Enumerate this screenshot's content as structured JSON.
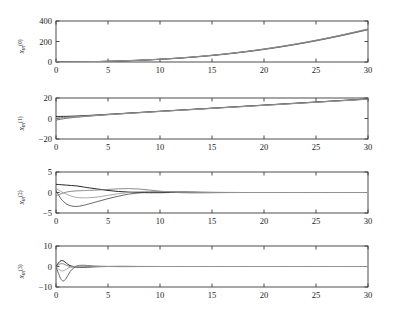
{
  "figure": {
    "background": "#ffffff",
    "axis_color": "#3a3a3a",
    "line_colors": [
      "#000000",
      "#4d4d4d",
      "#777777",
      "#9a9a9a"
    ],
    "xlabel": "",
    "xlim": [
      0,
      30
    ],
    "xticks": [
      0,
      5,
      10,
      15,
      20,
      25,
      30
    ],
    "xticklabels": [
      "0",
      "5",
      "10",
      "15",
      "20",
      "25",
      "30"
    ]
  },
  "chart_data": [
    {
      "type": "line",
      "title": "",
      "xlabel": "",
      "ylabel": "x_m^(0)",
      "ylabel_base": "x",
      "ylabel_sub": "m",
      "ylabel_sup": "(0)",
      "xlim": [
        0,
        30
      ],
      "ylim": [
        0,
        400
      ],
      "xticks": [
        0,
        5,
        10,
        15,
        20,
        25,
        30
      ],
      "yticks": [
        0,
        200,
        400
      ],
      "yticklabels": [
        "0",
        "200",
        "400"
      ],
      "grid": false,
      "legend": "none",
      "x": [
        0,
        1,
        2,
        3,
        4,
        5,
        6,
        7,
        8,
        9,
        10,
        11,
        12,
        13,
        14,
        15,
        16,
        17,
        18,
        19,
        20,
        21,
        22,
        23,
        24,
        25,
        26,
        27,
        28,
        29,
        30
      ],
      "series": [
        {
          "name": "agent 1",
          "values": [
            0,
            0.5,
            1.4,
            2.8,
            4.7,
            7.0,
            9.9,
            13.3,
            17.3,
            21.9,
            27.2,
            33.2,
            40.0,
            47.6,
            56.0,
            65.3,
            75.5,
            86.6,
            98.7,
            111.7,
            125.7,
            140.7,
            156.7,
            173.7,
            191.7,
            210.7,
            230.7,
            251.7,
            273.7,
            296.7,
            320.0
          ]
        },
        {
          "name": "agent 2",
          "values": [
            0,
            0.4,
            1.2,
            2.5,
            4.3,
            6.5,
            9.3,
            12.6,
            16.5,
            21.0,
            26.2,
            32.1,
            38.8,
            46.3,
            54.6,
            63.8,
            73.9,
            84.9,
            96.9,
            109.8,
            123.7,
            138.6,
            154.5,
            171.4,
            189.3,
            208.2,
            228.1,
            249.0,
            270.9,
            293.8,
            317.0
          ]
        },
        {
          "name": "agent 3",
          "values": [
            0,
            0.3,
            1.0,
            2.2,
            3.9,
            6.1,
            8.8,
            12.0,
            15.8,
            20.3,
            25.4,
            31.2,
            37.8,
            45.2,
            53.4,
            62.5,
            72.5,
            83.4,
            95.3,
            108.1,
            121.9,
            136.7,
            152.5,
            169.3,
            187.1,
            205.9,
            225.7,
            246.5,
            268.3,
            291.1,
            314.0
          ]
        },
        {
          "name": "agent 4",
          "values": [
            0,
            0.6,
            1.6,
            3.1,
            5.1,
            7.5,
            10.5,
            14.0,
            18.1,
            22.8,
            28.2,
            34.3,
            41.1,
            48.8,
            57.3,
            66.6,
            76.9,
            88.1,
            100.2,
            113.3,
            127.4,
            142.5,
            158.6,
            175.7,
            193.8,
            212.9,
            233.0,
            254.1,
            276.2,
            299.3,
            323.0
          ]
        }
      ]
    },
    {
      "type": "line",
      "title": "",
      "xlabel": "",
      "ylabel": "x_m^(1)",
      "ylabel_base": "x",
      "ylabel_sub": "m",
      "ylabel_sup": "(1)",
      "xlim": [
        0,
        30
      ],
      "ylim": [
        -20,
        20
      ],
      "xticks": [
        0,
        5,
        10,
        15,
        20,
        25,
        30
      ],
      "yticks": [
        -20,
        0,
        20
      ],
      "yticklabels": [
        "−20",
        "0",
        "20"
      ],
      "grid": false,
      "legend": "none",
      "x": [
        0,
        1,
        2,
        3,
        4,
        5,
        6,
        7,
        8,
        9,
        10,
        11,
        12,
        13,
        14,
        15,
        16,
        17,
        18,
        19,
        20,
        21,
        22,
        23,
        24,
        25,
        26,
        27,
        28,
        29,
        30
      ],
      "series": [
        {
          "name": "agent 1",
          "values": [
            2.0,
            2.1,
            2.4,
            2.9,
            3.5,
            4.1,
            4.7,
            5.3,
            5.9,
            6.5,
            7.1,
            7.7,
            8.3,
            8.9,
            9.5,
            10.1,
            10.7,
            11.3,
            11.9,
            12.5,
            13.1,
            13.7,
            14.3,
            14.9,
            15.5,
            16.1,
            16.7,
            17.3,
            17.9,
            18.5,
            19.1
          ]
        },
        {
          "name": "agent 2",
          "values": [
            -1.5,
            0.2,
            1.3,
            2.2,
            3.0,
            3.7,
            4.4,
            5.1,
            5.7,
            6.3,
            6.9,
            7.5,
            8.1,
            8.7,
            9.3,
            9.9,
            10.5,
            11.1,
            11.7,
            12.3,
            12.9,
            13.5,
            14.1,
            14.7,
            15.3,
            15.9,
            16.5,
            17.1,
            17.7,
            18.3,
            18.9
          ]
        },
        {
          "name": "agent 3",
          "values": [
            0.5,
            1.2,
            1.9,
            2.5,
            3.2,
            3.9,
            4.5,
            5.2,
            5.8,
            6.4,
            7.0,
            7.6,
            8.2,
            8.8,
            9.4,
            10.0,
            10.6,
            11.2,
            11.8,
            12.4,
            13.0,
            13.6,
            14.2,
            14.8,
            15.4,
            16.0,
            16.6,
            17.2,
            17.8,
            18.4,
            19.0
          ]
        },
        {
          "name": "agent 4",
          "values": [
            -0.5,
            0.8,
            1.6,
            2.3,
            3.1,
            3.8,
            4.4,
            5.0,
            5.6,
            6.2,
            6.8,
            7.4,
            8.0,
            8.6,
            9.2,
            9.8,
            10.4,
            11.0,
            11.6,
            12.2,
            12.8,
            13.4,
            14.0,
            14.6,
            15.2,
            15.8,
            16.4,
            17.0,
            17.6,
            18.2,
            18.8
          ]
        }
      ]
    },
    {
      "type": "line",
      "title": "",
      "xlabel": "",
      "ylabel": "x_m^(2)",
      "ylabel_base": "x",
      "ylabel_sub": "m",
      "ylabel_sup": "(2)",
      "xlim": [
        0,
        30
      ],
      "ylim": [
        -5,
        5
      ],
      "xticks": [
        0,
        5,
        10,
        15,
        20,
        25,
        30
      ],
      "yticks": [
        -5,
        0,
        5
      ],
      "yticklabels": [
        "−5",
        "0",
        "5"
      ],
      "grid": false,
      "legend": "none",
      "x": [
        0,
        0.5,
        1,
        1.5,
        2,
        2.5,
        3,
        4,
        5,
        6,
        7,
        8,
        9,
        10,
        11,
        12,
        13,
        14,
        15,
        16,
        18,
        20,
        22,
        24,
        26,
        28,
        30
      ],
      "series": [
        {
          "name": "agent 1",
          "values": [
            2.0,
            1.9,
            1.8,
            1.7,
            1.6,
            1.4,
            1.2,
            0.85,
            0.5,
            0.25,
            0.1,
            0.0,
            -0.05,
            -0.05,
            0.0,
            0.05,
            0.05,
            0.03,
            0.02,
            0.01,
            0.0,
            0.0,
            0.0,
            0.0,
            0.0,
            0.0,
            0.0
          ]
        },
        {
          "name": "agent 2",
          "values": [
            0.5,
            -1.6,
            -2.8,
            -3.3,
            -3.4,
            -3.2,
            -2.9,
            -2.2,
            -1.5,
            -0.9,
            -0.4,
            -0.1,
            0.1,
            0.2,
            0.2,
            0.15,
            0.1,
            0.05,
            0.02,
            0.01,
            0.0,
            0.0,
            0.0,
            0.0,
            0.0,
            0.0,
            0.0
          ]
        },
        {
          "name": "agent 3",
          "values": [
            -0.8,
            -0.3,
            0.1,
            0.3,
            0.4,
            0.45,
            0.5,
            0.6,
            0.75,
            0.9,
            0.95,
            0.85,
            0.6,
            0.3,
            0.1,
            -0.05,
            -0.1,
            -0.1,
            -0.05,
            -0.02,
            0.0,
            0.0,
            0.0,
            0.0,
            0.0,
            0.0,
            0.0
          ]
        },
        {
          "name": "agent 4",
          "values": [
            1.0,
            0.2,
            -0.4,
            -0.9,
            -1.2,
            -1.3,
            -1.3,
            -1.1,
            -0.7,
            -0.3,
            0.0,
            0.2,
            0.3,
            0.3,
            0.2,
            0.1,
            0.05,
            0.0,
            -0.02,
            -0.02,
            0.0,
            0.0,
            0.0,
            0.0,
            0.0,
            0.0,
            0.0
          ]
        }
      ]
    },
    {
      "type": "line",
      "title": "",
      "xlabel": "",
      "ylabel": "x_m^(3)",
      "ylabel_base": "x",
      "ylabel_sub": "m",
      "ylabel_sup": "(3)",
      "xlim": [
        0,
        30
      ],
      "ylim": [
        -10,
        10
      ],
      "xticks": [
        0,
        5,
        10,
        15,
        20,
        25,
        30
      ],
      "yticks": [
        -10,
        0,
        10
      ],
      "yticklabels": [
        "−10",
        "0",
        "10"
      ],
      "grid": false,
      "legend": "none",
      "x": [
        0,
        0.25,
        0.5,
        0.75,
        1,
        1.25,
        1.5,
        2,
        2.5,
        3,
        3.5,
        4,
        5,
        6,
        7,
        8,
        10,
        12,
        14,
        16,
        18,
        20,
        22,
        24,
        26,
        28,
        30
      ],
      "series": [
        {
          "name": "agent 1",
          "values": [
            0.0,
            1.8,
            2.9,
            2.6,
            1.6,
            0.7,
            0.2,
            -0.3,
            -0.4,
            -0.3,
            -0.2,
            -0.1,
            0.0,
            0.05,
            0.05,
            0.02,
            0.0,
            0.0,
            0.0,
            0.0,
            0.0,
            0.0,
            0.0,
            0.0,
            0.0,
            0.0,
            0.0
          ]
        },
        {
          "name": "agent 2",
          "values": [
            0.0,
            -3.5,
            -6.4,
            -7.0,
            -5.6,
            -3.4,
            -1.6,
            0.2,
            0.6,
            0.5,
            0.3,
            0.15,
            0.0,
            -0.05,
            -0.05,
            -0.02,
            0.0,
            0.0,
            0.0,
            0.0,
            0.0,
            0.0,
            0.0,
            0.0,
            0.0,
            0.0,
            0.0
          ]
        },
        {
          "name": "agent 3",
          "values": [
            0.0,
            0.9,
            1.4,
            1.2,
            0.6,
            0.1,
            -0.2,
            -0.4,
            -0.3,
            -0.15,
            -0.05,
            0.0,
            0.05,
            0.05,
            0.02,
            0.0,
            0.0,
            0.0,
            0.0,
            0.0,
            0.0,
            0.0,
            0.0,
            0.0,
            0.0,
            0.0,
            0.0
          ]
        },
        {
          "name": "agent 4",
          "values": [
            0.0,
            -1.2,
            -2.1,
            -2.0,
            -1.3,
            -0.6,
            -0.2,
            0.2,
            0.3,
            0.25,
            0.1,
            0.05,
            0.0,
            -0.02,
            -0.02,
            0.0,
            0.0,
            0.0,
            0.0,
            0.0,
            0.0,
            0.0,
            0.0,
            0.0,
            0.0,
            0.0,
            0.0
          ]
        }
      ]
    }
  ]
}
